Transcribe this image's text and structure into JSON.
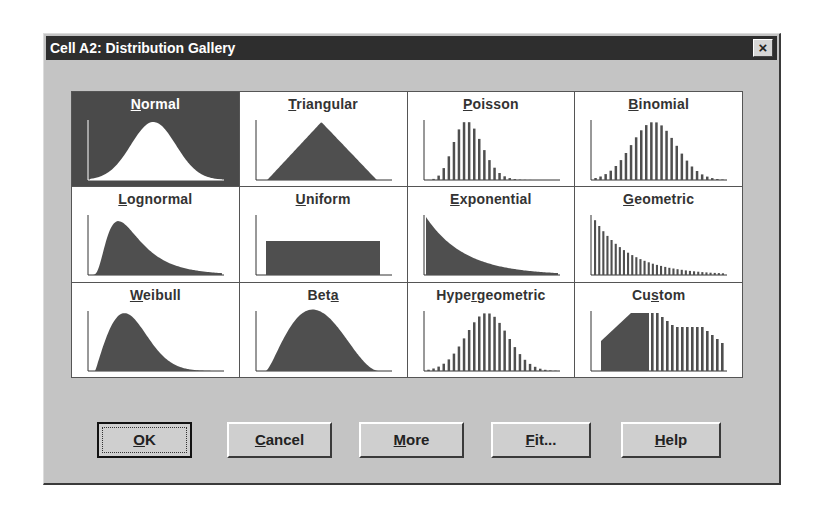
{
  "window": {
    "title": "Cell A2: Distribution Gallery",
    "close_label": "×"
  },
  "gallery": {
    "selected": "Normal",
    "items": [
      {
        "label": "Normal",
        "mnemonic": "N",
        "rest": "ormal",
        "prefix": "",
        "type": "curve-normal"
      },
      {
        "label": "Triangular",
        "mnemonic": "T",
        "rest": "riangular",
        "prefix": "",
        "type": "triangle"
      },
      {
        "label": "Poisson",
        "mnemonic": "P",
        "rest": "oisson",
        "prefix": "",
        "type": "bars-poisson"
      },
      {
        "label": "Binomial",
        "mnemonic": "B",
        "rest": "inomial",
        "prefix": "",
        "type": "bars-binomial"
      },
      {
        "label": "Lognormal",
        "mnemonic": "L",
        "rest": "ognormal",
        "prefix": "",
        "type": "curve-lognormal"
      },
      {
        "label": "Uniform",
        "mnemonic": "U",
        "rest": "niform",
        "prefix": "",
        "type": "rect"
      },
      {
        "label": "Exponential",
        "mnemonic": "E",
        "rest": "xponential",
        "prefix": "",
        "type": "curve-exponential"
      },
      {
        "label": "Geometric",
        "mnemonic": "G",
        "rest": "eometric",
        "prefix": "",
        "type": "bars-geometric"
      },
      {
        "label": "Weibull",
        "mnemonic": "W",
        "rest": "eibull",
        "prefix": "",
        "type": "curve-weibull"
      },
      {
        "label": "Beta",
        "mnemonic": "a",
        "rest": "",
        "prefix": "Bet",
        "type": "curve-beta"
      },
      {
        "label": "Hypergeometric",
        "mnemonic": "r",
        "rest": "geometric",
        "prefix": "Hype",
        "type": "bars-hypergeometric"
      },
      {
        "label": "Custom",
        "mnemonic": "s",
        "rest": "tom",
        "prefix": "Cu",
        "type": "custom"
      }
    ]
  },
  "buttons": {
    "ok": {
      "prefix": "",
      "mnemonic": "O",
      "rest": "K"
    },
    "cancel": {
      "prefix": "",
      "mnemonic": "C",
      "rest": "ancel"
    },
    "more": {
      "prefix": "",
      "mnemonic": "M",
      "rest": "ore"
    },
    "fit": {
      "prefix": "",
      "mnemonic": "F",
      "rest": "it..."
    },
    "help": {
      "prefix": "",
      "mnemonic": "H",
      "rest": "elp"
    }
  },
  "colors": {
    "titlebar": "#2e2e2e",
    "dialog_bg": "#c4c4c4",
    "selected_cell": "#4a4a4a",
    "shape_fill": "#4f4f4f"
  }
}
